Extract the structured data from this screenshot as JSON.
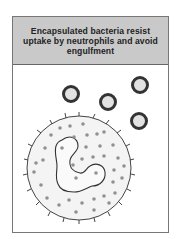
{
  "diagram": {
    "title": "Encapsulated bacteria resist uptake by neutrophils and avoid engulfment",
    "elements": {
      "bacteria": {
        "label": "encapsulated bacteria",
        "count": 4
      },
      "neutrophil": {
        "label": "neutrophil with multilobed nucleus and granules"
      }
    },
    "colors": {
      "header_bg": "#c9c9c9",
      "capsule": "#333333",
      "bacterium_core": "#e2e2e2",
      "granule": "#909090",
      "outline": "#444444"
    }
  }
}
